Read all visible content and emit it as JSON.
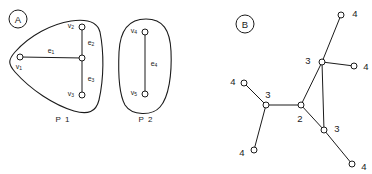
{
  "figure": {
    "width": 372,
    "height": 174,
    "background": "#ffffff",
    "ink": "#1b1b1b"
  },
  "panel_a": {
    "badge": "A",
    "badge_pos": [
      18,
      19
    ],
    "badge_r": 9,
    "regions": [
      {
        "id": "P1",
        "label": "P 1",
        "label_pos": [
          63,
          119
        ],
        "shape": "rounded-triangle",
        "path": "M 71 21 C 52 24 30 35 15 52 C 8 60 8 64 15 72 C 31 90 54 105 74 111 C 88 115 96 112 99 100 C 104 78 104 52 100 32 C 97 21 85 19 71 21 Z"
      },
      {
        "id": "P2",
        "label": "P 2",
        "label_pos": [
          146,
          119
        ],
        "shape": "oval",
        "path": "M 146 19 C 128 19 120 31 119 52 C 118 75 120 96 125 105 C 132 116 152 116 160 107 C 169 97 172 74 171 51 C 170 30 163 19 146 19 Z"
      }
    ],
    "vertices": [
      {
        "id": "v1",
        "label": "v",
        "sub": "1",
        "x": 20,
        "y": 57,
        "label_pos": [
          19,
          66
        ]
      },
      {
        "id": "v2",
        "label": "v",
        "sub": "2",
        "x": 82,
        "y": 27,
        "label_pos": [
          71,
          25
        ]
      },
      {
        "id": "v3",
        "label": "v",
        "sub": "3",
        "x": 82,
        "y": 95,
        "label_pos": [
          71,
          93
        ]
      },
      {
        "id": "hub",
        "label": "",
        "sub": "",
        "x": 82,
        "y": 58,
        "label_pos": [
          82,
          58
        ]
      },
      {
        "id": "v4",
        "label": "v",
        "sub": "4",
        "x": 145,
        "y": 32,
        "label_pos": [
          134,
          30
        ]
      },
      {
        "id": "v5",
        "label": "v",
        "sub": "5",
        "x": 145,
        "y": 94,
        "label_pos": [
          134,
          92
        ]
      }
    ],
    "edges": [
      {
        "id": "e1",
        "label": "e",
        "sub": "1",
        "from": [
          20,
          57
        ],
        "to": [
          82,
          58
        ],
        "label_pos": [
          51,
          50
        ]
      },
      {
        "id": "e2",
        "label": "e",
        "sub": "2",
        "from": [
          82,
          27
        ],
        "to": [
          82,
          58
        ],
        "label_pos": [
          91,
          42
        ]
      },
      {
        "id": "e3",
        "label": "e",
        "sub": "3",
        "from": [
          82,
          58
        ],
        "to": [
          82,
          95
        ],
        "label_pos": [
          91,
          78
        ]
      },
      {
        "id": "e4",
        "label": "e",
        "sub": "4",
        "from": [
          145,
          32
        ],
        "to": [
          145,
          94
        ],
        "label_pos": [
          154,
          63
        ]
      }
    ],
    "node_radius": 3
  },
  "panel_b": {
    "badge": "B",
    "badge_pos": [
      245,
      24
    ],
    "badge_r": 9,
    "node_radius": 3,
    "nodes": [
      {
        "id": "n-top-leaf",
        "degree": "4",
        "x": 341,
        "y": 15,
        "label_pos": [
          355,
          13
        ]
      },
      {
        "id": "n-right-leaf",
        "degree": "4",
        "x": 354,
        "y": 66,
        "label_pos": [
          366,
          66
        ]
      },
      {
        "id": "n-hub-top",
        "degree": "3",
        "x": 322,
        "y": 62,
        "label_pos": [
          308,
          60
        ]
      },
      {
        "id": "n-hub-bottom",
        "degree": "3",
        "x": 324,
        "y": 130,
        "label_pos": [
          337,
          128
        ]
      },
      {
        "id": "n-bottom-leaf",
        "degree": "4",
        "x": 352,
        "y": 164,
        "label_pos": [
          364,
          166
        ]
      },
      {
        "id": "n-center",
        "degree": "2",
        "x": 301,
        "y": 105,
        "label_pos": [
          300,
          118
        ]
      },
      {
        "id": "n-hub-left",
        "degree": "3",
        "x": 266,
        "y": 105,
        "label_pos": [
          268,
          94
        ]
      },
      {
        "id": "n-left-leaf",
        "degree": "4",
        "x": 244,
        "y": 83,
        "label_pos": [
          233,
          81
        ]
      },
      {
        "id": "n-lower-leaf",
        "degree": "4",
        "x": 254,
        "y": 150,
        "label_pos": [
          242,
          152
        ]
      }
    ],
    "edges": [
      {
        "id": "e-topleaf-hubtop",
        "from": [
          341,
          15
        ],
        "to": [
          322,
          62
        ]
      },
      {
        "id": "e-hubtop-rightleaf",
        "from": [
          322,
          62
        ],
        "to": [
          354,
          66
        ]
      },
      {
        "id": "e-hubtop-hubbottom",
        "from": [
          322,
          62
        ],
        "to": [
          324,
          130
        ]
      },
      {
        "id": "e-hubtop-center",
        "from": [
          322,
          62
        ],
        "to": [
          301,
          105
        ]
      },
      {
        "id": "e-center-hubbottom",
        "from": [
          301,
          105
        ],
        "to": [
          324,
          130
        ]
      },
      {
        "id": "e-hubbottom-botleaf",
        "from": [
          324,
          130
        ],
        "to": [
          352,
          164
        ]
      },
      {
        "id": "e-center-hubleft",
        "from": [
          301,
          105
        ],
        "to": [
          266,
          105
        ]
      },
      {
        "id": "e-hubleft-leftleaf",
        "from": [
          266,
          105
        ],
        "to": [
          244,
          83
        ]
      },
      {
        "id": "e-hubleft-lowerleaf",
        "from": [
          266,
          105
        ],
        "to": [
          254,
          150
        ]
      }
    ]
  }
}
